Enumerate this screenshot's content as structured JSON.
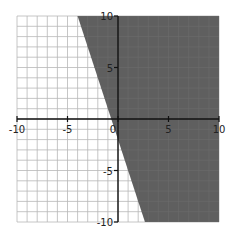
{
  "chart_data": {
    "type": "area",
    "title": "",
    "xlabel": "",
    "ylabel": "",
    "xlim": [
      -10,
      10
    ],
    "ylim": [
      -10,
      10
    ],
    "grid": true,
    "grid_step": 1,
    "x_ticks": [
      -10,
      -5,
      0,
      5,
      10
    ],
    "y_ticks": [
      -10,
      -5,
      5,
      10
    ],
    "x_tick_labels": [
      "-10",
      "-5",
      "0",
      "5",
      "10"
    ],
    "y_tick_labels": [
      "-10",
      "-5",
      "5",
      "10"
    ],
    "boundary_line": {
      "equation": "y = -3x - 2",
      "slope": -3,
      "intercept": -2,
      "style": "solid"
    },
    "shaded_region": "y >= -3x - 2",
    "shaded_polygon": [
      [
        -4,
        10
      ],
      [
        10,
        10
      ],
      [
        10,
        -10
      ],
      [
        2.67,
        -10
      ]
    ],
    "legend": []
  },
  "colors": {
    "shade": "#5f5f5f",
    "grid": "#b8b8b8",
    "axis": "#111111",
    "background": "#ffffff"
  }
}
